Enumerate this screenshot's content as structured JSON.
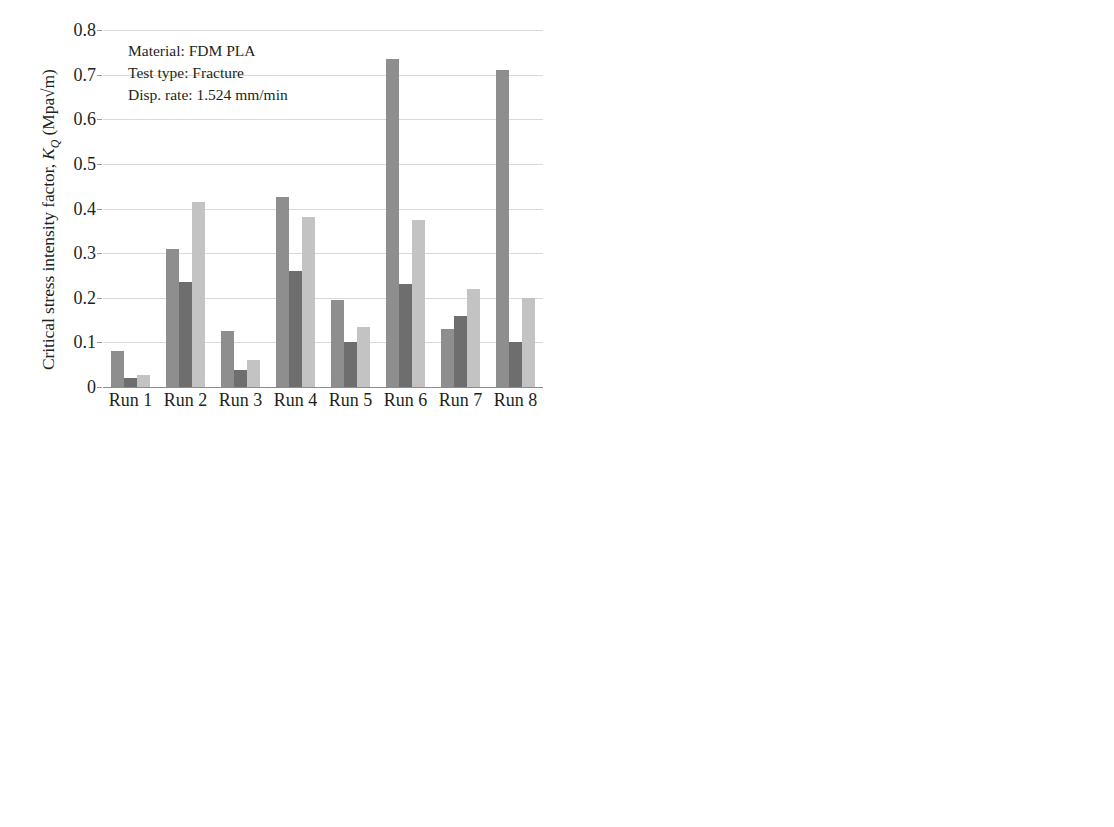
{
  "figure": {
    "panel_count": 4,
    "categories": [
      "Run 1",
      "Run 2",
      "Run 3",
      "Run 4",
      "Run 5",
      "Run 6",
      "Run 7",
      "Run 8"
    ],
    "series_names": [
      "L1-L2",
      "S-L1",
      "L1-S"
    ],
    "series_colors": [
      "#8e8e8e",
      "#6e6e6e",
      "#c3c3c3"
    ],
    "grid_color": "#d9d9d9"
  },
  "annotation": {
    "line1": "Material: FDM PLA",
    "line2": "Test type: Fracture",
    "line3": "Disp. rate: 1.524 mm/min"
  },
  "legend": {
    "items": [
      {
        "label_main": "L",
        "sub1": "1",
        "dash": "–",
        "label_main2": "L",
        "sub2": "2",
        "color": "#8e8e8e"
      },
      {
        "label_main": "S",
        "sub1": "",
        "dash": "–",
        "label_main2": "L",
        "sub2": "1",
        "color": "#6e6e6e"
      },
      {
        "label_main": "L",
        "sub1": "1",
        "dash": "–",
        "label_main2": "S",
        "sub2": "",
        "color": "#c3c3c3"
      }
    ]
  },
  "chart_data": [
    {
      "id": "critical-stress-intensity-factor",
      "type": "bar",
      "title": "",
      "ylabel": "Critical stress intensity factor, K_Q (Mpa√m)",
      "ylabel_prefix": "Critical stress intensity factor, ",
      "ylabel_sym": "K",
      "ylabel_sub": "Q",
      "ylabel_suffix": " (Mpa√m)",
      "xlabel": "",
      "ylim": [
        0,
        0.8
      ],
      "ytick_step": 0.1,
      "yticks": [
        "0",
        "0.1",
        "0.2",
        "0.3",
        "0.4",
        "0.5",
        "0.6",
        "0.7",
        "0.8"
      ],
      "categories": [
        "Run 1",
        "Run 2",
        "Run 3",
        "Run 4",
        "Run 5",
        "Run 6",
        "Run 7",
        "Run 8"
      ],
      "grid": true,
      "legend": false,
      "series": [
        {
          "name": "L1-L2",
          "values": [
            0.08,
            0.31,
            0.125,
            0.425,
            0.195,
            0.735,
            0.13,
            0.71
          ]
        },
        {
          "name": "S-L1",
          "values": [
            0.02,
            0.235,
            0.038,
            0.26,
            0.1,
            0.23,
            0.16,
            0.1
          ]
        },
        {
          "name": "L1-S",
          "values": [
            0.027,
            0.415,
            0.06,
            0.38,
            0.135,
            0.375,
            0.22,
            0.2
          ]
        }
      ]
    },
    {
      "id": "ultimate-load",
      "type": "bar",
      "title": "",
      "ylabel": "Ultimate load, P_ult (N)",
      "ylabel_prefix": "Ultimate load, ",
      "ylabel_sym": "P",
      "ylabel_sub": "ult",
      "ylabel_suffix": " (N)",
      "xlabel": "",
      "ylim": [
        0,
        500
      ],
      "ytick_step": 50,
      "yticks": [
        "0",
        "50",
        "100",
        "150",
        "200",
        "250",
        "300",
        "350",
        "400",
        "450",
        "500"
      ],
      "categories": [
        "Run 1",
        "Run 2",
        "Run 3",
        "Run 4",
        "Run 5",
        "Run 6",
        "Run 7",
        "Run 8"
      ],
      "grid": true,
      "legend": true,
      "legend_position": "top-center",
      "series": [
        {
          "name": "L1-L2",
          "values": [
            64,
            243,
            88,
            277,
            124,
            426,
            128,
            374
          ]
        },
        {
          "name": "S-L1",
          "values": [
            9,
            107,
            20,
            116,
            52,
            100,
            70,
            47
          ]
        },
        {
          "name": "L1-S",
          "values": [
            13,
            216,
            32,
            184,
            77,
            161,
            100,
            89
          ]
        }
      ]
    },
    {
      "id": "energy-absorbed",
      "type": "bar",
      "title": "",
      "ylabel": "Energy absorbed, U_TF (J)",
      "ylabel_prefix": "Energy absorbed, ",
      "ylabel_sym": "U",
      "ylabel_sub": "TF",
      "ylabel_suffix": " (J)",
      "xlabel": "",
      "ylim": [
        0,
        0.6
      ],
      "ytick_step": 0.1,
      "yticks": [
        "0",
        "0.1",
        "0.2",
        "0.3",
        "0.4",
        "0.5",
        "0.6"
      ],
      "categories": [
        "Run 1",
        "Run 2",
        "Run 3",
        "Run 4",
        "Run 5",
        "Run 6",
        "Run 7",
        "Run 8"
      ],
      "grid": true,
      "legend": false,
      "series": [
        {
          "name": "L1-L2",
          "values": [
            0.175,
            0.395,
            0.193,
            0.497,
            0.212,
            0.333,
            0.358,
            0.252
          ]
        },
        {
          "name": "S-L1",
          "values": [
            0.002,
            0.021,
            0.003,
            0.028,
            0.012,
            0.015,
            0.017,
            0.004
          ]
        },
        {
          "name": "L1-S",
          "values": [
            0.005,
            0.082,
            0.015,
            0.08,
            0.036,
            0.037,
            0.032,
            0.013
          ]
        }
      ]
    },
    {
      "id": "strength-ratio",
      "type": "bar",
      "title": "",
      "ylabel": "Strenght ratio, R_SC",
      "ylabel_prefix": "Strenght ratio, ",
      "ylabel_sym": "R",
      "ylabel_sub": "SC",
      "ylabel_suffix": "",
      "xlabel": "",
      "ylim": [
        0,
        4000
      ],
      "ytick_step": 500,
      "yticks": [
        "0",
        "500",
        "1000",
        "1500",
        "2000",
        "2500",
        "3000",
        "3500",
        "4000"
      ],
      "categories": [
        "Run 1",
        "Run 2",
        "Run 3",
        "Run 4",
        "Run 5",
        "Run 6",
        "Run 7",
        "Run 8"
      ],
      "grid": true,
      "legend": false,
      "series": [
        {
          "name": "L1-L2",
          "values": [
            1265,
            2080,
            1500,
            3730,
            2955,
            1980,
            760,
            1665
          ]
        },
        {
          "name": "S-L1",
          "values": [
            400,
            780,
            780,
            1555,
            345,
            1395,
            425,
            685
          ]
        },
        {
          "name": "L1-S",
          "values": [
            255,
            595,
            405,
            700,
            425,
            555,
            305,
            325
          ]
        }
      ]
    }
  ]
}
